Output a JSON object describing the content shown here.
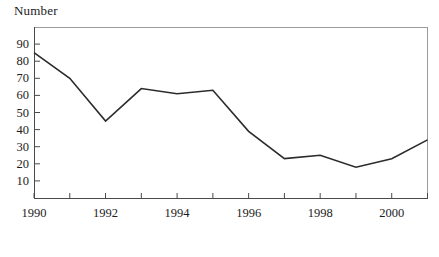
{
  "chart_data": {
    "type": "line",
    "title": "",
    "subtitle": "",
    "ylabel": "Number",
    "xlabel": "",
    "x": [
      1990,
      1991,
      1992,
      1993,
      1994,
      1995,
      1996,
      1997,
      1998,
      1999,
      2000,
      2001
    ],
    "values": [
      85,
      70,
      45,
      64,
      61,
      63,
      39,
      23,
      25,
      18,
      23,
      34
    ],
    "series": [
      {
        "name": "Number",
        "values": [
          85,
          70,
          45,
          64,
          61,
          63,
          39,
          23,
          25,
          18,
          23,
          34
        ]
      }
    ],
    "xlim": [
      1990,
      2001
    ],
    "ylim": [
      0,
      100
    ],
    "ytick_values": [
      10,
      20,
      30,
      40,
      50,
      60,
      70,
      80,
      90
    ],
    "ytick_labels": [
      "10",
      "20",
      "30",
      "40",
      "50",
      "60",
      "70",
      "80",
      "90"
    ],
    "xtick_values": [
      1990,
      1991,
      1992,
      1993,
      1994,
      1995,
      1996,
      1997,
      1998,
      1999,
      2000,
      2001
    ],
    "xtick_labels_shown": [
      "1990",
      "1992",
      "1994",
      "1996",
      "1998",
      "2000"
    ],
    "xtick_labeled_values": [
      1990,
      1992,
      1994,
      1996,
      1998,
      2000
    ],
    "grid": false,
    "legend": false,
    "legend_position": "none",
    "line_color": "#2b2b2b",
    "frame_color": "#4a4a4a",
    "background_color": "#ffffff"
  },
  "axis": {
    "y_label_text": "Number"
  }
}
